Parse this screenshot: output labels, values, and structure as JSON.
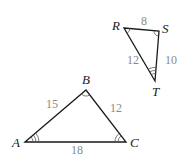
{
  "figure": {
    "triangles": [
      {
        "name": "ABC",
        "vertices": {
          "A": "A",
          "B": "B",
          "C": "C"
        },
        "sides": {
          "AB": "15",
          "BC": "12",
          "AC": "18"
        },
        "angle_marks": {
          "A": 3,
          "B": 1,
          "C": 2
        }
      },
      {
        "name": "RST",
        "vertices": {
          "R": "R",
          "S": "S",
          "T": "T"
        },
        "sides": {
          "RS": "8",
          "ST": "10",
          "RT": "12"
        },
        "angle_marks": {
          "R": 1,
          "S": 2,
          "T": 3
        }
      }
    ]
  }
}
